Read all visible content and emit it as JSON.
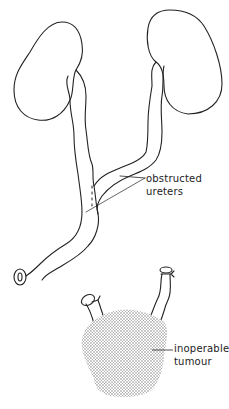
{
  "figure": {
    "colors": {
      "ink": "#222222",
      "stipple": "#8a8a8a",
      "background": "#ffffff"
    }
  },
  "labels": {
    "obstructed_ureters": {
      "line1": "obstructed",
      "line2": "ureters"
    },
    "inoperable_tumour": {
      "line1": "inoperable",
      "line2": "tumour"
    }
  },
  "structures": [
    {
      "name": "left-kidney"
    },
    {
      "name": "right-kidney"
    },
    {
      "name": "left-ureter"
    },
    {
      "name": "right-ureter"
    },
    {
      "name": "ureterostomy-stoma"
    },
    {
      "name": "ligated-ureter-stump-left"
    },
    {
      "name": "ligated-ureter-stump-right"
    },
    {
      "name": "tumour-mass"
    }
  ]
}
